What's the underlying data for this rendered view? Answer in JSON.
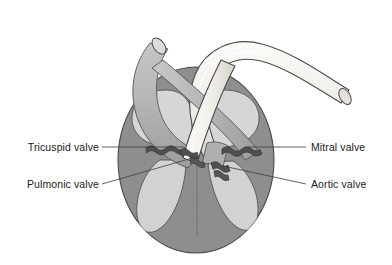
{
  "labels": [
    {
      "id": "tricuspid",
      "text": "Tricuspid valve",
      "side": "left",
      "x": 130,
      "y": 150
    },
    {
      "id": "pulmonic",
      "text": "Pulmonic valve",
      "side": "left",
      "x": 130,
      "y": 187
    },
    {
      "id": "mitral",
      "text": "Mitral valve",
      "side": "right",
      "x": 310,
      "y": 150
    },
    {
      "id": "aortic",
      "text": "Aortic valve",
      "side": "right",
      "x": 310,
      "y": 187
    }
  ],
  "anatomy": {
    "myocardium": "myocardium-wall",
    "right_atrium": "right-atrium-chamber",
    "left_atrium": "left-atrium-chamber",
    "right_ventricle": "right-ventricle-chamber",
    "left_ventricle": "left-ventricle-chamber",
    "septum": "interventricular-septum",
    "pulmonary_artery": "pulmonary-artery-trunk",
    "aorta": "aorta-arch"
  },
  "colors": {
    "myocardium": "#8e8e8e",
    "chamber": "#d2d2d2",
    "chamber_light": "#dcdcdc",
    "pulmonary_artery": "#b6b6b6",
    "pulmonary_artery_shade": "#a2a2a2",
    "aorta": "#f1efea",
    "aorta_shade": "#dedbd4",
    "valve_dark": "#4f4f4f",
    "outline": "#4a4a4a",
    "leader": "#3c3c3c",
    "text": "#1a1a1a",
    "background": "#ffffff"
  }
}
